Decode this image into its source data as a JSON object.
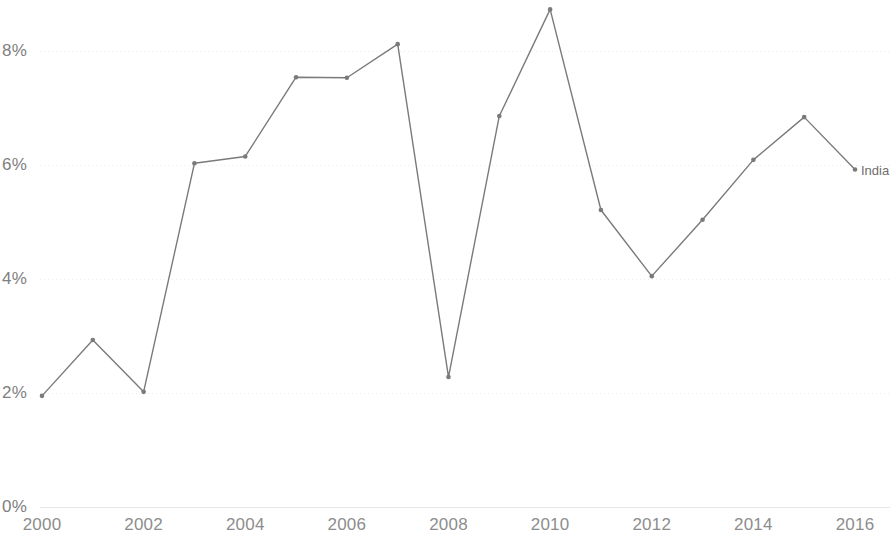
{
  "chart_data": {
    "type": "line",
    "title": "",
    "subtitle": "",
    "xlabel": "",
    "ylabel": "",
    "x": [
      2000,
      2001,
      2002,
      2003,
      2004,
      2005,
      2006,
      2007,
      2008,
      2009,
      2010,
      2011,
      2012,
      2013,
      2014,
      2015,
      2016
    ],
    "xlim": [
      2000,
      2016
    ],
    "ylim": [
      0,
      9.2
    ],
    "grid": true,
    "legend_position": "end-of-line",
    "series": [
      {
        "name": "India",
        "color": "#7a7a7a",
        "values": [
          1.95,
          2.93,
          2.02,
          6.03,
          6.15,
          7.54,
          7.53,
          8.12,
          2.28,
          6.86,
          8.73,
          5.21,
          4.05,
          5.04,
          6.09,
          6.84,
          5.92
        ]
      }
    ],
    "x_tick_labels": [
      "2000",
      "2002",
      "2004",
      "2006",
      "2008",
      "2010",
      "2012",
      "2014",
      "2016"
    ],
    "x_tick_values": [
      2000,
      2002,
      2004,
      2006,
      2008,
      2010,
      2012,
      2014,
      2016
    ],
    "y_tick_labels": [
      "0%",
      "2%",
      "4%",
      "6%",
      "8%"
    ],
    "y_tick_values": [
      0,
      2,
      4,
      6,
      8
    ],
    "annotations": [
      {
        "text": "India",
        "x": 2016,
        "y": 5.92
      }
    ]
  },
  "colors": {
    "line": "#7a7a7a",
    "gridline": "#ededed",
    "axis_text": "#8d8d8d",
    "y_axis_text": "#808080",
    "label_text": "#6e6e6e",
    "background": "#ffffff"
  },
  "series_end_label": "India"
}
